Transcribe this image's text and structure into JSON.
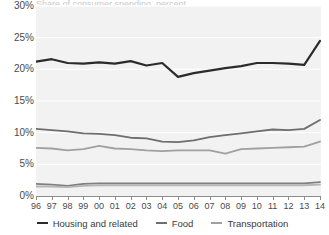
{
  "title_remnant": "Share of consumer spending, percent",
  "axes": {
    "y_ticks": [
      "0%",
      "5%",
      "10%",
      "15%",
      "20%",
      "25%",
      "30%"
    ],
    "x_ticks": [
      "96",
      "97",
      "98",
      "99",
      "00",
      "01",
      "02",
      "03",
      "04",
      "05",
      "06",
      "07",
      "08",
      "09",
      "10",
      "11",
      "12",
      "13",
      "14"
    ]
  },
  "legend": {
    "items": [
      {
        "label": "Housing and related",
        "color": "#2b2b2b"
      },
      {
        "label": "Food",
        "color": "#6e6e6e"
      },
      {
        "label": "Transportation",
        "color": "#a0a0a0"
      }
    ]
  },
  "colors": {
    "plot_background": "#f2f2f2",
    "gridline": "#ffffff",
    "axis": "#8c8c8c",
    "tick_text": "#4a4a4a",
    "housing": "#2b2b2b",
    "food": "#6e6e6e",
    "transportation": "#a0a0a0",
    "other_a": "#7f7f7f",
    "other_b": "#b5b5b5"
  },
  "chart_data": {
    "type": "line",
    "title": "",
    "xlabel": "",
    "ylabel": "",
    "ylim": [
      0,
      30
    ],
    "ytick_step": 5,
    "grid": true,
    "legend_position": "bottom-center",
    "x": [
      "96",
      "97",
      "98",
      "99",
      "00",
      "01",
      "02",
      "03",
      "04",
      "05",
      "06",
      "07",
      "08",
      "09",
      "10",
      "11",
      "12",
      "13",
      "14"
    ],
    "series": [
      {
        "name": "Housing and related",
        "color": "#2b2b2b",
        "values": [
          21.2,
          21.6,
          21.0,
          20.9,
          21.1,
          20.9,
          21.3,
          20.6,
          21.0,
          18.8,
          19.4,
          19.8,
          20.2,
          20.5,
          21.0,
          21.0,
          20.9,
          20.7,
          24.5
        ]
      },
      {
        "name": "Food",
        "color": "#6e6e6e",
        "values": [
          10.6,
          10.4,
          10.2,
          9.9,
          9.8,
          9.6,
          9.2,
          9.1,
          8.6,
          8.5,
          8.8,
          9.3,
          9.6,
          9.9,
          10.2,
          10.5,
          10.4,
          10.6,
          12.0
        ]
      },
      {
        "name": "Transportation",
        "color": "#a0a0a0",
        "values": [
          7.6,
          7.5,
          7.2,
          7.4,
          7.9,
          7.5,
          7.4,
          7.2,
          7.1,
          7.2,
          7.2,
          7.2,
          6.7,
          7.4,
          7.5,
          7.6,
          7.7,
          7.8,
          8.6
        ]
      },
      {
        "name": "",
        "color": "#7f7f7f",
        "values": [
          1.9,
          1.8,
          1.6,
          1.9,
          2.0,
          2.0,
          2.0,
          2.0,
          2.0,
          2.0,
          2.0,
          2.0,
          2.0,
          2.0,
          2.0,
          2.0,
          2.0,
          2.0,
          2.2
        ]
      },
      {
        "name": "",
        "color": "#b5b5b5",
        "values": [
          1.5,
          1.5,
          1.4,
          1.6,
          1.7,
          1.7,
          1.7,
          1.7,
          1.7,
          1.7,
          1.7,
          1.7,
          1.7,
          1.7,
          1.7,
          1.7,
          1.7,
          1.7,
          1.8
        ]
      }
    ]
  }
}
